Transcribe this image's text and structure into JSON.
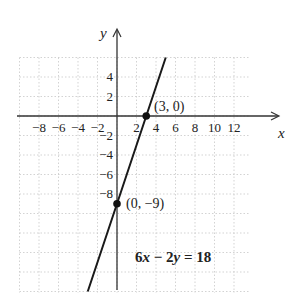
{
  "chart_data": {
    "type": "line",
    "title": "",
    "equation": "6x − 2y = 18",
    "xlabel": "x",
    "ylabel": "y",
    "xlim": [
      -10,
      14
    ],
    "ylim": [
      -18,
      6
    ],
    "grid": true,
    "grid_step": 2,
    "x_ticks": [
      -8,
      -6,
      -4,
      -2,
      2,
      4,
      6,
      8,
      10,
      12
    ],
    "x_tick_labels": [
      "−8",
      "−6",
      "−4",
      "−2",
      "2",
      "4",
      "6",
      "8",
      "10",
      "12"
    ],
    "y_ticks": [
      4,
      2,
      -2,
      -4,
      -6,
      -8
    ],
    "y_tick_labels": [
      "4",
      "2",
      "−2",
      "−4",
      "−6",
      "−8"
    ],
    "series": [
      {
        "name": "6x − 2y = 18",
        "x": [
          -3,
          5
        ],
        "y": [
          -18,
          6
        ],
        "slope": 3,
        "intercept": -9
      }
    ],
    "points": [
      {
        "x": 3,
        "y": 0,
        "label": "(3, 0)"
      },
      {
        "x": 0,
        "y": -9,
        "label": "(0, −9)"
      }
    ],
    "annotations": [
      "(3, 0)",
      "(0, −9)",
      "6x − 2y = 18"
    ]
  },
  "labels": {
    "x_axis": "x",
    "y_axis": "y",
    "point1": "(3, 0)",
    "point2": "(0, −9)",
    "eq_coef1": "6",
    "eq_var1": "x",
    "eq_op": " − 2",
    "eq_var2": "y",
    "eq_rhs": " = 18"
  }
}
